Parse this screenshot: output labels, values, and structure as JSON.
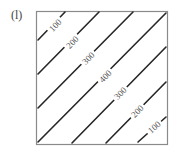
{
  "panel": {
    "label": "(l)"
  },
  "colors": {
    "frame": "#8a8a8a",
    "contour": "#262626",
    "label": "#555555",
    "background": "#ffffff"
  },
  "chart_data": {
    "type": "contour",
    "title": "",
    "xlabel": "",
    "ylabel": "",
    "grid": false,
    "legend": "none",
    "frame": {
      "x": 36,
      "y": 11,
      "width": 131,
      "height": 133
    },
    "contours": [
      {
        "level": 100,
        "label": "100",
        "x1": 38,
        "y1": 40,
        "x2": 65,
        "y2": 12,
        "lx": 55,
        "ly": 25
      },
      {
        "level": 200,
        "label": "200",
        "x1": 38,
        "y1": 74,
        "x2": 99,
        "y2": 12,
        "lx": 72,
        "ly": 42
      },
      {
        "level": 300,
        "label": "300",
        "x1": 38,
        "y1": 108,
        "x2": 133,
        "y2": 12,
        "lx": 88,
        "ly": 58
      },
      {
        "level": 400,
        "label": "400",
        "x1": 38,
        "y1": 142,
        "x2": 166,
        "y2": 13,
        "lx": 105,
        "ly": 76
      },
      {
        "level": 300,
        "label": "300",
        "x1": 72,
        "y1": 143,
        "x2": 166,
        "y2": 47,
        "lx": 120,
        "ly": 93
      },
      {
        "level": 200,
        "label": "200",
        "x1": 106,
        "y1": 143,
        "x2": 166,
        "y2": 82,
        "lx": 137,
        "ly": 111
      },
      {
        "level": 100,
        "label": "100",
        "x1": 138,
        "y1": 142,
        "x2": 166,
        "y2": 117,
        "lx": 154,
        "ly": 127
      }
    ]
  }
}
